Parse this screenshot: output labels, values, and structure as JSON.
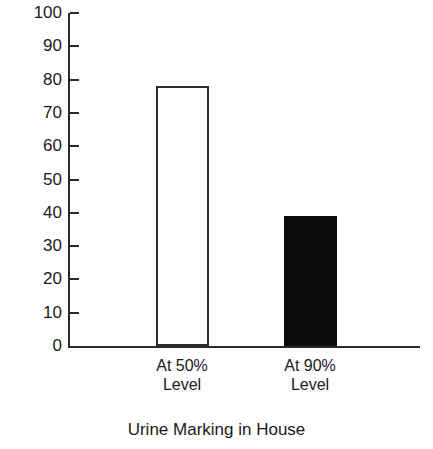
{
  "chart_data": {
    "type": "bar",
    "title": "",
    "xlabel": "Urine Marking in House",
    "ylabel": "Percent",
    "categories": [
      "At 50% Level",
      "At 90% Level"
    ],
    "category_lines": [
      [
        "At 50%",
        "Level"
      ],
      [
        "At 90%",
        "Level"
      ]
    ],
    "values": [
      78,
      39
    ],
    "ylim": [
      0,
      100
    ],
    "yticks": [
      0,
      10,
      20,
      30,
      40,
      50,
      60,
      70,
      80,
      90,
      100
    ],
    "ytick_labels": [
      "0",
      "10",
      "20",
      "30",
      "40",
      "50",
      "60",
      "70",
      "80",
      "90",
      "100"
    ],
    "grid": false,
    "legend": false,
    "bar_styles": [
      {
        "name": "hollow",
        "fill": "#ffffff",
        "stroke": "#2b2b2b"
      },
      {
        "name": "filled",
        "fill": "#0d0d0d",
        "stroke": "#0d0d0d"
      }
    ],
    "colors": {
      "axis": "#2b2b2b",
      "text": "#1a1a1a",
      "background": "#ffffff"
    }
  },
  "axes": {
    "y_title": "Percent",
    "x_title": "Urine Marking in House"
  }
}
